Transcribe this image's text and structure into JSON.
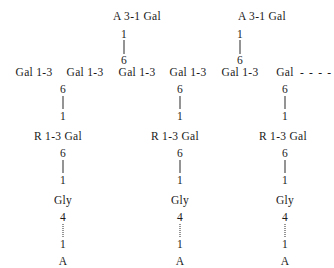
{
  "figure": {
    "type": "glycan-structure-diagram",
    "background": "#ffffff",
    "ink": "#1a1a1a"
  },
  "backbone": {
    "label": "main-chain",
    "units": [
      {
        "text": "Gal 1-3",
        "x": 34
      },
      {
        "text": "Gal 1-3",
        "x": 85
      },
      {
        "text": "Gal 1-3",
        "x": 137
      },
      {
        "text": "Gal 1-3",
        "x": 188
      },
      {
        "text": "Gal 1-3",
        "x": 240
      },
      {
        "text": "Gal",
        "x": 285
      }
    ],
    "continuation": {
      "text": "- - - -",
      "x": 300
    },
    "y": 72
  },
  "upper_branches": [
    {
      "x": 124,
      "cap": "A 3-1 Gal",
      "cap_x": 137,
      "cap_y": 16,
      "top_locant": "1",
      "top_locant_y": 34,
      "bottom_locant": "6",
      "bottom_locant_y": 60,
      "bond_top": 40,
      "bond_bottom": 54
    },
    {
      "x": 240,
      "cap": "A 3-1 Gal",
      "cap_x": 262,
      "cap_y": 16,
      "top_locant": "1",
      "top_locant_y": 34,
      "bottom_locant": "6",
      "bottom_locant_y": 60,
      "bond_top": 40,
      "bond_bottom": 54
    }
  ],
  "lower_branches": [
    {
      "x": 63,
      "residue_label": "R 1-3 Gal",
      "residue_x": 58,
      "locant_top_1": "6",
      "locant_top_1_y": 89,
      "locant_bottom_1": "1",
      "locant_bottom_1_y": 116,
      "residue_y": 136,
      "locant_top_2": "6",
      "locant_top_2_y": 153,
      "locant_bottom_2": "1",
      "locant_bottom_2_y": 180,
      "gly_label": "Gly",
      "gly_y": 200,
      "locant_top_3": "4",
      "locant_top_3_y": 217,
      "locant_bottom_3": "1",
      "locant_bottom_3_y": 244,
      "terminal_label": "A",
      "terminal_y": 261
    },
    {
      "x": 180,
      "residue_label": "R 1-3 Gal",
      "residue_x": 175,
      "locant_top_1": "6",
      "locant_top_1_y": 89,
      "locant_bottom_1": "1",
      "locant_bottom_1_y": 116,
      "residue_y": 136,
      "locant_top_2": "6",
      "locant_top_2_y": 153,
      "locant_bottom_2": "1",
      "locant_bottom_2_y": 180,
      "gly_label": "Gly",
      "gly_y": 200,
      "locant_top_3": "4",
      "locant_top_3_y": 217,
      "locant_bottom_3": "1",
      "locant_bottom_3_y": 244,
      "terminal_label": "A",
      "terminal_y": 261
    },
    {
      "x": 285,
      "residue_label": "R 1-3 Gal",
      "residue_x": 283,
      "locant_top_1": "6",
      "locant_top_1_y": 89,
      "locant_bottom_1": "1",
      "locant_bottom_1_y": 116,
      "residue_y": 136,
      "locant_top_2": "6",
      "locant_top_2_y": 153,
      "locant_bottom_2": "1",
      "locant_bottom_2_y": 180,
      "gly_label": "Gly",
      "gly_y": 200,
      "locant_top_3": "4",
      "locant_top_3_y": 217,
      "locant_bottom_3": "1",
      "locant_bottom_3_y": 244,
      "terminal_label": "A",
      "terminal_y": 261
    }
  ]
}
